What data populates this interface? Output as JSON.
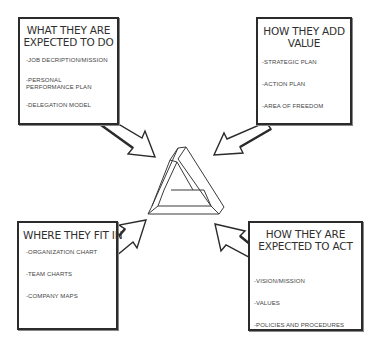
{
  "diagram": {
    "center_icon": "penrose-triangle-icon",
    "boxes": [
      {
        "id": "top-left",
        "title": "WHAT THEY ARE EXPECTED TO DO",
        "title_lines": [
          "WHAT THEY ARE",
          "EXPECTED TO DO"
        ],
        "items": [
          "JOB DECRIPTION/MISSION",
          "PERSONAL PERFORMANCE PLAN",
          "DELEGATION MODEL"
        ],
        "arrow_direction": "down-right"
      },
      {
        "id": "top-right",
        "title": "HOW THEY ADD VALUE",
        "title_lines": [
          "HOW THEY ADD",
          "VALUE"
        ],
        "items": [
          "STRATEGIC PLAN",
          "ACTION PLAN",
          "AREA OF FREEDOM"
        ],
        "arrow_direction": "down-left"
      },
      {
        "id": "bottom-left",
        "title": "WHERE THEY FIT IN",
        "title_lines": [
          "WHERE THEY FIT IN"
        ],
        "items": [
          "ORGANIZATION CHART",
          "TEAM CHARTS",
          "COMPANY MAPS"
        ],
        "arrow_direction": "up-right"
      },
      {
        "id": "bottom-right",
        "title": "HOW THEY ARE EXPECTED TO ACT",
        "title_lines": [
          "HOW THEY ARE",
          "EXPECTED TO ACT"
        ],
        "items": [
          "VISION/MISSION",
          "VALUES",
          "POLICIES AND PROCEDURES"
        ],
        "arrow_direction": "up-left"
      }
    ],
    "colors": {
      "background": "#ffffff",
      "stroke": "#2b2b2b",
      "text": "#2f2f2f"
    }
  }
}
